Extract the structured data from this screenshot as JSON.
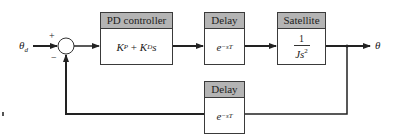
{
  "diagram": {
    "type": "feedback control block diagram",
    "input_signal": "θd",
    "output_signal": "θ",
    "summing_junction": {
      "plus_sign": "+",
      "minus_sign": "−"
    },
    "blocks": {
      "pd_controller": {
        "title": "PD controller",
        "tf_KP": "K",
        "tf_KP_sub": "P",
        "tf_plus": " + ",
        "tf_KD": "K",
        "tf_KD_sub": "D",
        "tf_s": "s"
      },
      "delay_forward": {
        "title": "Delay",
        "tf_base": "e",
        "tf_exp": "−sT"
      },
      "satellite": {
        "title": "Satellite",
        "tf_num": "1",
        "tf_den_base": "Js",
        "tf_den_exp": "2"
      },
      "delay_feedback": {
        "title": "Delay",
        "tf_base": "e",
        "tf_exp": "−sT"
      }
    },
    "colors": {
      "line": "#222222",
      "header_fill": "#b4b4b4",
      "block_border": "#3a3a3a",
      "background": "#ffffff"
    },
    "stray_mark": "d"
  }
}
